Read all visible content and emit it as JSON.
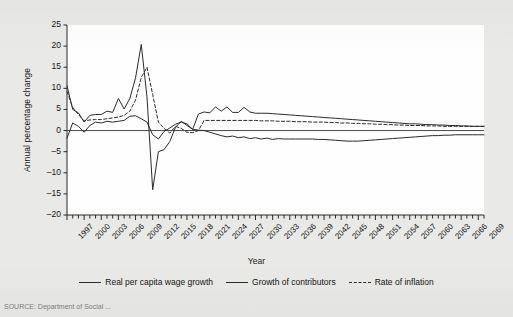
{
  "figure": {
    "source_note": "SOURCE: Department of Social ...",
    "background_color": "#e8e8e6",
    "plot_background_color": "#fefefe",
    "line_color": "#2b2b2b"
  },
  "chart_data": {
    "type": "line",
    "title": "",
    "xlabel": "Year",
    "ylabel": "Annual percentage change",
    "xlim": [
      1997,
      2070
    ],
    "ylim": [
      -20,
      25
    ],
    "yticks": [
      -20,
      -15,
      -10,
      -5,
      0,
      5,
      10,
      15,
      20,
      25
    ],
    "ytick_labels": [
      "–20",
      "–15",
      "–10",
      "–5",
      "0",
      "5",
      "10",
      "15",
      "20",
      "25"
    ],
    "xtick_labels": [
      "1997",
      "2000",
      "2003",
      "2006",
      "2009",
      "2012",
      "2015",
      "2018",
      "2021",
      "2024",
      "2027",
      "2030",
      "2033",
      "2036",
      "2039",
      "2042",
      "2045",
      "2048",
      "2051",
      "2054",
      "2057",
      "2060",
      "2063",
      "2066",
      "2069"
    ],
    "xtick_step_minor": 1,
    "xtick_label_step": 3,
    "grid": false,
    "legend_position": "bottom",
    "zero_line": true,
    "x": [
      1997,
      1998,
      1999,
      2000,
      2001,
      2002,
      2003,
      2004,
      2005,
      2006,
      2007,
      2008,
      2009,
      2010,
      2011,
      2012,
      2013,
      2014,
      2015,
      2016,
      2017,
      2018,
      2019,
      2020,
      2021,
      2022,
      2023,
      2024,
      2025,
      2026,
      2027,
      2028,
      2029,
      2030,
      2031,
      2032,
      2033,
      2034,
      2035,
      2036,
      2037,
      2038,
      2039,
      2040,
      2041,
      2042,
      2043,
      2044,
      2045,
      2046,
      2047,
      2048,
      2049,
      2050,
      2051,
      2052,
      2053,
      2054,
      2055,
      2056,
      2057,
      2058,
      2059,
      2060,
      2061,
      2062,
      2063,
      2064,
      2065,
      2066,
      2067,
      2068,
      2069,
      2070
    ],
    "series": [
      {
        "name": "Real per capita wage growth",
        "style": "solid",
        "values": [
          10.6,
          5.0,
          4.2,
          2.0,
          3.6,
          3.8,
          3.8,
          4.6,
          4.3,
          7.6,
          5.1,
          7.6,
          12.5,
          20.4,
          8.0,
          -14.0,
          -5.0,
          -4.5,
          -2.6,
          0.8,
          2.2,
          1.2,
          0.3,
          3.9,
          4.4,
          4.2,
          5.6,
          4.6,
          5.6,
          4.3,
          4.3,
          5.5,
          4.4,
          4.1,
          4.1,
          4.1,
          4.0,
          3.9,
          3.8,
          3.7,
          3.6,
          3.5,
          3.4,
          3.3,
          3.2,
          3.1,
          3.0,
          2.9,
          2.8,
          2.7,
          2.6,
          2.5,
          2.4,
          2.3,
          2.2,
          2.1,
          2.0,
          1.9,
          1.8,
          1.7,
          1.6,
          1.6,
          1.5,
          1.4,
          1.4,
          1.3,
          1.3,
          1.2,
          1.2,
          1.1,
          1.1,
          1.0,
          1.0,
          1.0
        ]
      },
      {
        "name": "Growth of contributors",
        "style": "solid",
        "values": [
          -1.8,
          1.8,
          1.0,
          -0.4,
          1.2,
          2.0,
          1.8,
          2.2,
          2.0,
          2.2,
          2.4,
          3.4,
          3.5,
          2.8,
          2.0,
          -1.0,
          -2.0,
          -0.2,
          0.6,
          1.5,
          2.0,
          1.6,
          0.3,
          0.1,
          0.0,
          -0.4,
          -0.8,
          -1.2,
          -1.5,
          -1.3,
          -1.7,
          -1.5,
          -1.9,
          -1.7,
          -2.0,
          -1.8,
          -2.1,
          -1.9,
          -2.0,
          -2.0,
          -2.0,
          -2.0,
          -2.0,
          -2.0,
          -2.1,
          -2.1,
          -2.2,
          -2.3,
          -2.4,
          -2.5,
          -2.5,
          -2.5,
          -2.4,
          -2.3,
          -2.2,
          -2.1,
          -2.0,
          -1.9,
          -1.8,
          -1.7,
          -1.6,
          -1.5,
          -1.4,
          -1.3,
          -1.2,
          -1.2,
          -1.1,
          -1.1,
          -1.0,
          -1.0,
          -1.0,
          -1.0,
          -1.0,
          -1.0
        ]
      },
      {
        "name": "Rate of inflation",
        "style": "dashed",
        "values": [
          9.2,
          5.5,
          3.8,
          2.3,
          2.5,
          2.6,
          2.6,
          2.8,
          3.0,
          3.2,
          3.6,
          4.6,
          7.2,
          12.6,
          15.0,
          8.5,
          2.0,
          0.5,
          -0.6,
          1.0,
          0.5,
          -0.4,
          -0.5,
          0.0,
          2.4,
          2.4,
          2.4,
          2.4,
          2.4,
          2.4,
          2.4,
          2.4,
          2.4,
          2.4,
          2.3,
          2.3,
          2.3,
          2.2,
          2.2,
          2.2,
          2.1,
          2.1,
          2.1,
          2.0,
          2.0,
          2.0,
          1.9,
          1.9,
          1.8,
          1.8,
          1.7,
          1.7,
          1.6,
          1.6,
          1.5,
          1.5,
          1.4,
          1.4,
          1.3,
          1.3,
          1.2,
          1.2,
          1.2,
          1.1,
          1.1,
          1.1,
          1.0,
          1.0,
          1.0,
          1.0,
          1.0,
          1.0,
          1.0,
          1.0
        ]
      }
    ]
  },
  "legend": {
    "items": [
      {
        "label": "Real per capita wage growth",
        "style": "solid"
      },
      {
        "label": "Growth of contributors",
        "style": "solid"
      },
      {
        "label": "Rate of inflation",
        "style": "dashed"
      }
    ]
  }
}
